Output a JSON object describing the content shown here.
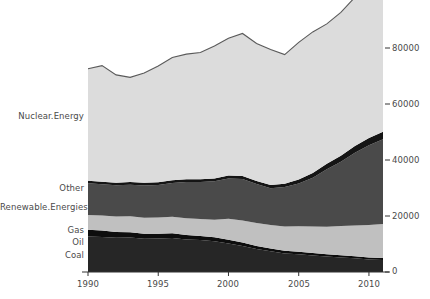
{
  "chart_data": {
    "type": "area",
    "stacked": true,
    "title": "",
    "xlabel": "",
    "ylabel": "",
    "xlim": [
      1990,
      2011
    ],
    "ylim": [
      0,
      95000
    ],
    "yticks": [
      0,
      20000,
      40000,
      60000,
      80000
    ],
    "ytick_labels": [
      "0",
      "20000",
      "40000",
      "60000",
      "80000"
    ],
    "xticks": [
      1990,
      1995,
      2000,
      2005,
      2010
    ],
    "xtick_labels": [
      "1990",
      "1995",
      "2000",
      "2005",
      "2010"
    ],
    "grid": false,
    "legend_position": "left-inline",
    "x": [
      1990,
      1991,
      1992,
      1993,
      1994,
      1995,
      1996,
      1997,
      1998,
      1999,
      2000,
      2001,
      2002,
      2003,
      2004,
      2005,
      2006,
      2007,
      2008,
      2009,
      2010,
      2011
    ],
    "series": [
      {
        "name": "Coal",
        "color": "#262626",
        "values": [
          12700,
          12500,
          12200,
          12300,
          11900,
          12000,
          12100,
          11600,
          11400,
          11000,
          10200,
          9300,
          8200,
          7400,
          6600,
          6300,
          5900,
          5500,
          5200,
          4900,
          4500,
          4300
        ]
      },
      {
        "name": "Oil",
        "color": "#0d0d0d",
        "values": [
          2400,
          2300,
          2100,
          1900,
          1800,
          1700,
          1700,
          1600,
          1500,
          1400,
          1300,
          1200,
          1100,
          1000,
          950,
          900,
          850,
          800,
          750,
          720,
          700,
          680
        ]
      },
      {
        "name": "Gas",
        "color": "#c0c0c0",
        "values": [
          5300,
          5400,
          5500,
          5700,
          5700,
          5800,
          5900,
          6000,
          6000,
          6300,
          7500,
          7900,
          8200,
          8400,
          8700,
          9100,
          9500,
          9900,
          10500,
          11000,
          11600,
          12200
        ]
      },
      {
        "name": "Renewable.Energies",
        "color": "#4a4a4a",
        "values": [
          11300,
          11100,
          11200,
          11300,
          11500,
          11600,
          12100,
          12900,
          13200,
          13700,
          14400,
          14800,
          13900,
          13100,
          14100,
          15300,
          17400,
          20500,
          22900,
          26000,
          28500,
          30200
        ]
      },
      {
        "name": "Other",
        "color": "#151515",
        "values": [
          900,
          900,
          900,
          900,
          950,
          950,
          1000,
          1000,
          1000,
          1000,
          1050,
          1100,
          1100,
          1150,
          1200,
          1400,
          1700,
          2000,
          2200,
          2400,
          2600,
          2700
        ]
      },
      {
        "name": "Nuclear.Energy",
        "color": "#dcdcdc",
        "values": [
          40000,
          41500,
          38500,
          37400,
          39200,
          41500,
          43800,
          44700,
          45300,
          47300,
          49000,
          50900,
          49100,
          48400,
          46100,
          49000,
          50400,
          49900,
          51200,
          53100,
          55300,
          53500
        ]
      }
    ]
  },
  "axis": {
    "y_tick_labels": [
      "80000",
      "60000",
      "40000",
      "20000",
      "0"
    ],
    "x_tick_labels": [
      "1990",
      "1995",
      "2000",
      "2005",
      "2010"
    ]
  },
  "series_labels": [
    {
      "name": "Nuclear.Energy"
    },
    {
      "name": "Other"
    },
    {
      "name": "Renewable.Energies"
    },
    {
      "name": "Gas"
    },
    {
      "name": "Oil"
    },
    {
      "name": "Coal"
    }
  ],
  "colors": {
    "nuclear": "#dcdcdc",
    "other": "#151515",
    "renewable": "#4a4a4a",
    "gas": "#c0c0c0",
    "oil": "#0d0d0d",
    "coal": "#262626",
    "outline": "#5a5a5a",
    "axis": "#333333",
    "text": "#4a4a4a",
    "background": "#ffffff"
  }
}
